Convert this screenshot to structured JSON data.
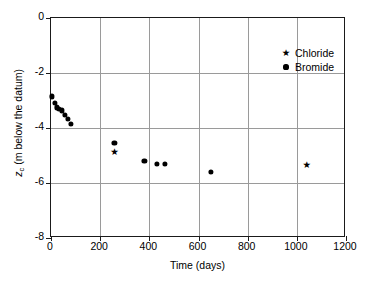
{
  "chart_data": {
    "type": "scatter",
    "title": "",
    "xlabel": "Time (days)",
    "ylabel": "z_c (m below the datum)",
    "ylabel_parts": {
      "variable": "z",
      "subscript": "c",
      "rest": " (m below the datum)"
    },
    "xlim": [
      0,
      1200
    ],
    "ylim": [
      -8,
      0
    ],
    "xticks": [
      0,
      200,
      400,
      600,
      800,
      1000,
      1200
    ],
    "xticklabels": [
      "0",
      "200",
      "400",
      "600",
      "800",
      "1000",
      "1200"
    ],
    "yticks": [
      0,
      -2,
      -4,
      -6,
      -8
    ],
    "yticklabels": [
      "0",
      "-2",
      "-4",
      "-6",
      "-8"
    ],
    "grid": true,
    "gridlines_x": [
      200,
      400,
      600,
      800,
      1000
    ],
    "gridlines_y": [
      -2,
      -4,
      -6
    ],
    "grid_color": "#9a9a9a",
    "frame_color": "#1a1a1a",
    "background": "#ffffff",
    "marker_color": "#000000",
    "legend_position": "upper right inside",
    "series": [
      {
        "name": "Chloride",
        "marker": "star",
        "color": "#000000",
        "points": [
          {
            "x": 258,
            "y": -4.88
          },
          {
            "x": 1040,
            "y": -5.33
          }
        ]
      },
      {
        "name": "Bromide",
        "marker": "circle",
        "color": "#000000",
        "points": [
          {
            "x": 5,
            "y": -2.85
          },
          {
            "x": 15,
            "y": -3.1
          },
          {
            "x": 24,
            "y": -3.25
          },
          {
            "x": 33,
            "y": -3.3
          },
          {
            "x": 43,
            "y": -3.36
          },
          {
            "x": 56,
            "y": -3.52
          },
          {
            "x": 70,
            "y": -3.66
          },
          {
            "x": 82,
            "y": -3.86
          },
          {
            "x": 258,
            "y": -4.55
          },
          {
            "x": 380,
            "y": -5.2
          },
          {
            "x": 430,
            "y": -5.3
          },
          {
            "x": 462,
            "y": -5.32
          },
          {
            "x": 650,
            "y": -5.6
          }
        ]
      }
    ]
  },
  "legend": {
    "entries": [
      {
        "label": "Chloride",
        "marker_glyph": "★"
      },
      {
        "label": "Bromide",
        "marker_glyph": "●"
      }
    ]
  }
}
